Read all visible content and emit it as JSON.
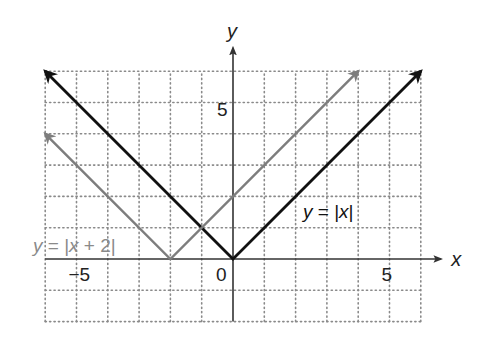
{
  "chart_data": {
    "type": "line",
    "title": "",
    "xlabel": "x",
    "ylabel": "y",
    "xlim": [
      -6,
      6
    ],
    "ylim": [
      -2,
      6
    ],
    "grid": true,
    "grid_style": "dotted",
    "x_tick_labels": [
      {
        "value": -5,
        "label": "−5"
      },
      {
        "value": 0,
        "label": "0"
      },
      {
        "value": 5,
        "label": "5"
      }
    ],
    "y_tick_labels": [
      {
        "value": 5,
        "label": "5"
      }
    ],
    "series": [
      {
        "name": "y = |x|",
        "label_parts": [
          "y",
          " = |",
          "x",
          "|"
        ],
        "color": "#111111",
        "points": [
          [
            -6,
            6
          ],
          [
            0,
            0
          ],
          [
            6,
            6
          ]
        ],
        "arrows": "both"
      },
      {
        "name": "y = |x + 2|",
        "label_parts": [
          "y",
          " = |",
          "x",
          " + 2|"
        ],
        "color": "#7d7d7d",
        "points": [
          [
            -6,
            4
          ],
          [
            -2,
            0
          ],
          [
            4,
            6
          ]
        ],
        "arrows": "both"
      }
    ],
    "legend": "inline labels"
  },
  "colors": {
    "axis": "#333333",
    "grid": "#8a8a8a",
    "black_line": "#111111",
    "gray_line": "#7d7d7d",
    "gray_text": "#8a8a8a"
  }
}
